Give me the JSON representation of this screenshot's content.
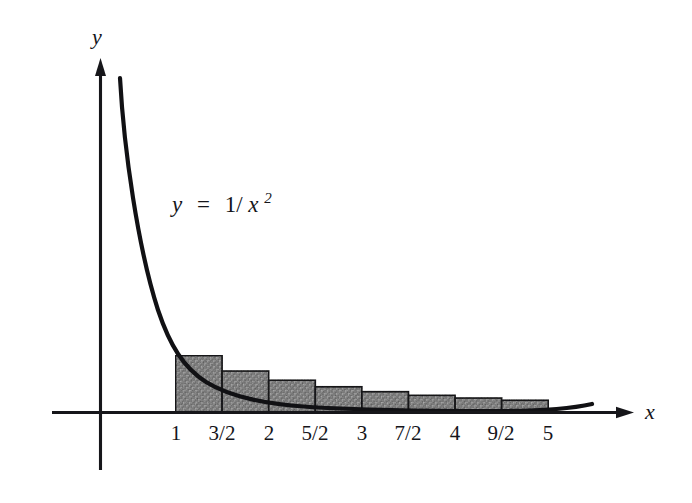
{
  "figure": {
    "background_color": "#ffffff",
    "ink_color": "#16161a",
    "bar_fill_color": "#9a9a9a",
    "bar_edge_color": "#1a1a1d"
  },
  "axes": {
    "x_axis_label": "x",
    "y_axis_label": "y",
    "origin_px": {
      "x": 100,
      "y": 412
    },
    "x_axis_end_px": 632,
    "y_axis_top_px": 62,
    "y_axis_bottom_px": 470,
    "unit_px_per_half_step": 46.6
  },
  "annotations": {
    "equation_lhs": "y",
    "equation_eq": "=",
    "equation_numerator": "1/",
    "equation_base": "x",
    "equation_exponent": "2",
    "equation_full": "y = 1/x²"
  },
  "chart_data": {
    "type": "area",
    "xlabel": "x",
    "ylabel": "y",
    "grid": false,
    "legend": "none",
    "xlim": [
      0,
      6.4
    ],
    "ylim": [
      0,
      4.2
    ],
    "function": "y = 1/x^2",
    "curve_points": [
      {
        "x": 0.45,
        "y": 4.94
      },
      {
        "x": 0.6,
        "y": 2.78
      },
      {
        "x": 0.8,
        "y": 1.56
      },
      {
        "x": 1.0,
        "y": 1.0
      },
      {
        "x": 1.5,
        "y": 0.444
      },
      {
        "x": 2.0,
        "y": 0.25
      },
      {
        "x": 2.5,
        "y": 0.16
      },
      {
        "x": 3.0,
        "y": 0.111
      },
      {
        "x": 3.5,
        "y": 0.082
      },
      {
        "x": 4.0,
        "y": 0.0625
      },
      {
        "x": 4.5,
        "y": 0.049
      },
      {
        "x": 5.0,
        "y": 0.04
      },
      {
        "x": 5.5,
        "y": 0.033
      },
      {
        "x": 6.0,
        "y": 0.028
      }
    ],
    "rectangles": {
      "rule": "right-endpoint",
      "width": 0.5,
      "bars": [
        {
          "x_left": 1.0,
          "x_right": 1.5,
          "height": 1.0
        },
        {
          "x_left": 1.5,
          "x_right": 2.0,
          "height": 0.72
        },
        {
          "x_left": 2.0,
          "x_right": 2.5,
          "height": 0.56
        },
        {
          "x_left": 2.5,
          "x_right": 3.0,
          "height": 0.44
        },
        {
          "x_left": 3.0,
          "x_right": 3.5,
          "height": 0.35
        },
        {
          "x_left": 3.5,
          "x_right": 4.0,
          "height": 0.28
        },
        {
          "x_left": 4.0,
          "x_right": 4.5,
          "height": 0.23
        },
        {
          "x_left": 4.5,
          "x_right": 5.0,
          "height": 0.19
        },
        {
          "x_left": 5.0,
          "x_right": 5.5,
          "height": 0.155
        }
      ]
    },
    "x_ticks": [
      {
        "label": "1",
        "value": 1,
        "px": 176
      },
      {
        "label": "3/2",
        "value": 1.5,
        "px": 222
      },
      {
        "label": "2",
        "value": 2,
        "px": 269
      },
      {
        "label": "5/2",
        "value": 2.5,
        "px": 315
      },
      {
        "label": "3",
        "value": 3,
        "px": 362
      },
      {
        "label": "7/2",
        "value": 3.5,
        "px": 408
      },
      {
        "label": "4",
        "value": 4,
        "px": 455
      },
      {
        "label": "9/2",
        "value": 4.5,
        "px": 501
      },
      {
        "label": "5",
        "value": 5,
        "px": 548
      }
    ],
    "y_ticks": []
  }
}
